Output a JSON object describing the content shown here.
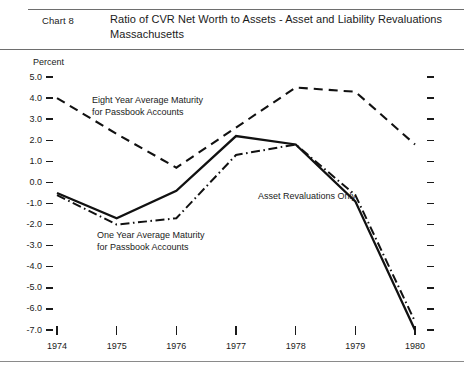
{
  "header": {
    "chart_number": "Chart 8",
    "title_line1": "Ratio of CVR Net Worth to Assets - Asset and Liability Revaluations",
    "title_line2": "Massachusetts"
  },
  "chart_data": {
    "type": "line",
    "title": "Ratio of CVR Net Worth to Assets - Asset and Liability Revaluations Massachusetts",
    "subtitle": "Massachusetts",
    "xlabel": "",
    "ylabel": "Percent",
    "ylim": [
      -7.0,
      5.0
    ],
    "xlim": [
      1974,
      1980
    ],
    "grid": false,
    "legend_position": "inline-annotations",
    "ytick_labels": [
      "5.0",
      "4.0",
      "3.0",
      "2.0",
      "1.0",
      "0.0",
      "-1.0",
      "-2.0",
      "-3.0",
      "-4.0",
      "-5.0",
      "-6.0",
      "-7.0"
    ],
    "ytick_values": [
      5.0,
      4.0,
      3.0,
      2.0,
      1.0,
      0.0,
      -1.0,
      -2.0,
      -3.0,
      -4.0,
      -5.0,
      -6.0,
      -7.0
    ],
    "categories": [
      "1974",
      "1975",
      "1976",
      "1977",
      "1978",
      "1979",
      "1980"
    ],
    "x": [
      1974,
      1975,
      1976,
      1977,
      1978,
      1979,
      1980
    ],
    "series": [
      {
        "name": "Eight Year Average Maturity for Passbook Accounts",
        "style": "dashed",
        "values": [
          4.0,
          2.3,
          0.7,
          2.6,
          4.5,
          4.3,
          1.8
        ]
      },
      {
        "name": "Asset Revaluations Only",
        "style": "solid",
        "values": [
          -0.5,
          -1.7,
          -0.4,
          2.2,
          1.8,
          -0.9,
          -7.0
        ]
      },
      {
        "name": "One Year Average Maturity for Passbook Accounts",
        "style": "dash-dot",
        "values": [
          -0.6,
          -2.0,
          -1.7,
          1.3,
          1.8,
          -0.6,
          -6.6
        ]
      }
    ],
    "annotations": [
      {
        "id": "eight-year",
        "line1": "Eight Year Average Maturity",
        "line2": "for Passbook Accounts"
      },
      {
        "id": "one-year",
        "line1": "One Year Average Maturity",
        "line2": "for Passbook Accounts"
      },
      {
        "id": "asset-revaluations",
        "line1": "Asset Revaluations Only",
        "line2": ""
      }
    ]
  },
  "axis": {
    "unit_label": "Percent",
    "y_labels": [
      "5.0",
      "4.0",
      "3.0",
      "2.0",
      "1.0",
      "0.0",
      "-1.0",
      "-2.0",
      "-3.0",
      "-4.0",
      "-5.0",
      "-6.0",
      "-7.0"
    ],
    "x_labels": [
      "1974",
      "1975",
      "1976",
      "1977",
      "1978",
      "1979",
      "1980"
    ]
  },
  "annotations": {
    "eight_year_l1": "Eight Year Average Maturity",
    "eight_year_l2": "for Passbook Accounts",
    "one_year_l1": "One Year Average Maturity",
    "one_year_l2": "for Passbook Accounts",
    "asset_only": "Asset Revaluations Only"
  }
}
